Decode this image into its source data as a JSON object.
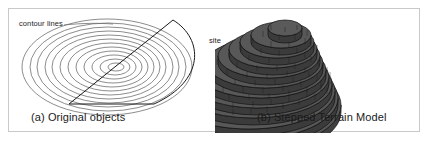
{
  "figure": {
    "background_color": "#ffffff",
    "frame_color": "#c9c9c9",
    "width": 430,
    "height": 142
  },
  "panel_a": {
    "caption": "(a) Original objects",
    "annotations": {
      "contour_lines_label": "contour lines",
      "site_label": "site"
    },
    "contour_line_color": "#6f6f6f",
    "site_outline_color": "#1a1a1a",
    "contour_ring_count": 12,
    "contour_center": {
      "x": 107,
      "y": 58
    },
    "contour_rings_rx": [
      8,
      15,
      22,
      29,
      36,
      43,
      50,
      58,
      66,
      74,
      82,
      90
    ],
    "contour_rings_ry": [
      4,
      8,
      12,
      16,
      20,
      24,
      28,
      32,
      36,
      40,
      44,
      48
    ]
  },
  "panel_b": {
    "caption": "(b) Stepped Terrain Model",
    "model_top_color": "#5a5a5a",
    "model_side_color": "#3f3f3f",
    "model_outline_color": "#111111",
    "step_count": 12,
    "step_labels": [
      "1",
      "2",
      "3",
      "4",
      "5",
      "6",
      "7",
      "8",
      "9",
      "10",
      "11",
      "12"
    ]
  },
  "icons": {
    "leader_line": "leader-line-icon"
  }
}
